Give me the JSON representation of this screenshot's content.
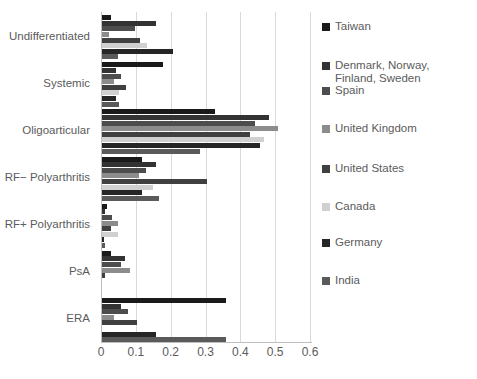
{
  "chart_data": {
    "type": "bar",
    "orientation": "horizontal",
    "title": "",
    "subtitle": "",
    "xlabel": "",
    "ylabel": "",
    "xlim": [
      0,
      0.6
    ],
    "ylim": null,
    "grid": true,
    "xticks": [
      0,
      0.1,
      0.2,
      0.3,
      0.4,
      0.5,
      0.6
    ],
    "xtick_labels": [
      "0",
      "0.1",
      "0.2",
      "0.3",
      "0.4",
      "0.5",
      "0.6"
    ],
    "legend_position": "right",
    "categories": [
      "Undifferentiated",
      "Systemic",
      "Oligoarticular",
      "RF− Polyarthritis",
      "RF+ Polyarthritis",
      "PsA",
      "ERA"
    ],
    "series": [
      {
        "name": "Taiwan",
        "color": "#1a1a1a",
        "values": [
          0.025,
          0.175,
          0.325,
          0.115,
          0.015,
          0.025,
          0.355
        ]
      },
      {
        "name": "Denmark, Norway, Finland, Sweden",
        "color": "#333333",
        "values": [
          0.155,
          0.04,
          0.48,
          0.155,
          0.01,
          0.065,
          0.055
        ]
      },
      {
        "name": "Spain",
        "color": "#4d4d4d",
        "values": [
          0.095,
          0.055,
          0.44,
          0.125,
          0.03,
          0.055,
          0.075
        ]
      },
      {
        "name": "United Kingdom",
        "color": "#8c8c8c",
        "values": [
          0.02,
          0.035,
          0.505,
          0.105,
          0.045,
          0.08,
          0.035
        ]
      },
      {
        "name": "United States",
        "color": "#404040",
        "values": [
          0.11,
          0.07,
          0.425,
          0.3,
          0.025,
          0.01,
          0.1
        ]
      },
      {
        "name": "Canada",
        "color": "#d0d0d0",
        "values": [
          0.13,
          0.05,
          0.465,
          0.145,
          0.045,
          0.0,
          0.0
        ]
      },
      {
        "name": "Germany",
        "color": "#262626",
        "values": [
          0.205,
          0.04,
          0.455,
          0.115,
          0.005,
          0.0,
          0.155
        ]
      },
      {
        "name": "India",
        "color": "#5a5a5a",
        "values": [
          0.045,
          0.05,
          0.28,
          0.165,
          0.01,
          0.0,
          0.355
        ]
      }
    ]
  }
}
